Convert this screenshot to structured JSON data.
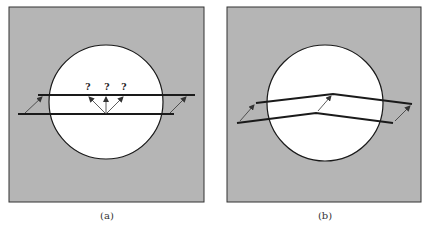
{
  "colors": {
    "background": "#ffffff",
    "panel_fill": "#b5b5b5",
    "circle_fill": "#ffffff",
    "stroke": "#1a1a1a",
    "arrow": "#333333"
  },
  "panels": [
    {
      "id": "a",
      "caption": "(a)",
      "question_marks": [
        "?",
        "?",
        "?"
      ]
    },
    {
      "id": "b",
      "caption": "(b)"
    }
  ]
}
